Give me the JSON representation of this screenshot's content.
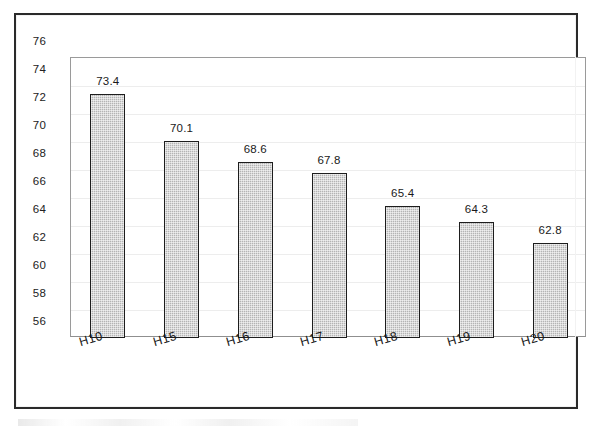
{
  "chart_data": {
    "type": "bar",
    "title": "",
    "subtitle": "",
    "xlabel": "",
    "ylabel": "",
    "categories": [
      "H10",
      "H15",
      "H16",
      "H17",
      "H18",
      "H19",
      "H20"
    ],
    "values": [
      73.4,
      70.1,
      68.6,
      67.8,
      65.4,
      64.3,
      62.8
    ],
    "data_labels": [
      "73.4",
      "70.1",
      "68.6",
      "67.8",
      "65.4",
      "64.3",
      "62.8"
    ],
    "ylim": [
      56,
      76
    ],
    "ytick_step": 2,
    "ytick_labels": [
      "76",
      "74",
      "72",
      "70",
      "68",
      "66",
      "64",
      "62",
      "60",
      "58",
      "56"
    ],
    "grid": true,
    "grid_axis": "y",
    "legend": null,
    "legend_position": "none",
    "bar_fill_color": "#b4b4b4",
    "bar_fill_pattern": "fine-checker-gray",
    "bar_border_color": "#1d1d1d",
    "gridline_color": "#ededed",
    "axis_color": "#9a9a9a",
    "plot_background": "#ffffff",
    "frame_border_color": "#2a2a2a",
    "xtick_label_rotation_deg": -16
  }
}
